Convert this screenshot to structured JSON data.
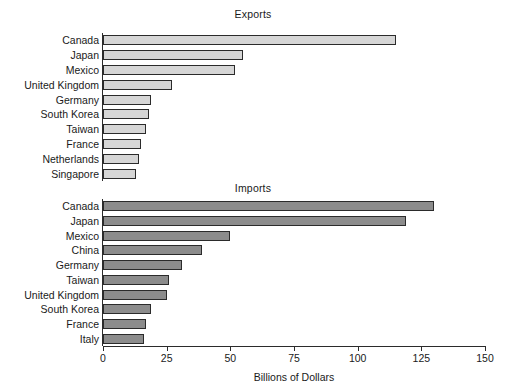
{
  "chart_data": {
    "type": "bar",
    "orientation": "horizontal",
    "title": "",
    "xlabel": "Billions of Dollars",
    "ylabel": "",
    "xlim": [
      0,
      150
    ],
    "xticks": [
      0,
      25,
      50,
      75,
      100,
      125,
      150
    ],
    "xtick_labels": [
      "0",
      "25",
      "50",
      "75",
      "100",
      "125",
      "150"
    ],
    "grid": false,
    "legend": "none",
    "panels": [
      {
        "title": "Exports",
        "bar_color": "#d6d6d6",
        "edge_color": "#2b2b2b",
        "categories": [
          "Canada",
          "Japan",
          "Mexico",
          "United Kingdom",
          "Germany",
          "South Korea",
          "Taiwan",
          "France",
          "Netherlands",
          "Singapore"
        ],
        "values": [
          115,
          55,
          52,
          27,
          19,
          18,
          17,
          15,
          14,
          13
        ]
      },
      {
        "title": "Imports",
        "bar_color": "#8c8c8c",
        "edge_color": "#2b2b2b",
        "categories": [
          "Canada",
          "Japan",
          "Mexico",
          "China",
          "Germany",
          "Taiwan",
          "United Kingdom",
          "South Korea",
          "France",
          "Italy"
        ],
        "values": [
          130,
          119,
          50,
          39,
          31,
          26,
          25,
          19,
          17,
          16
        ]
      }
    ]
  }
}
